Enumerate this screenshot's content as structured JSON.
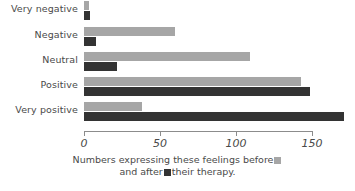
{
  "chart_data": {
    "type": "bar",
    "orientation": "horizontal",
    "title": "",
    "xlabel": "",
    "ylabel": "",
    "xlim": [
      0,
      160
    ],
    "xticks": [
      0,
      50,
      100,
      150
    ],
    "xticklabels": [
      "0",
      "50",
      "100",
      "150"
    ],
    "grid": false,
    "legend_position": "bottom-inline",
    "categories": [
      "Very negative",
      "Negative",
      "Neutral",
      "Positive",
      "Very positive"
    ],
    "series": [
      {
        "name": "before",
        "color": "#a6a6a6",
        "values": [
          3,
          60,
          109,
          143,
          38
        ]
      },
      {
        "name": "after",
        "color": "#333333",
        "values": [
          4,
          8,
          22,
          149,
          171
        ]
      }
    ],
    "caption": {
      "line1_prefix": "Numbers expressing these feelings before",
      "line2_middle": "and after",
      "line2_suffix": "their therapy."
    }
  },
  "colors": {
    "before": "#a6a6a6",
    "after": "#333333",
    "axis": "#8c8c8c",
    "text": "#4a4a4a",
    "background": "#ffffff"
  }
}
